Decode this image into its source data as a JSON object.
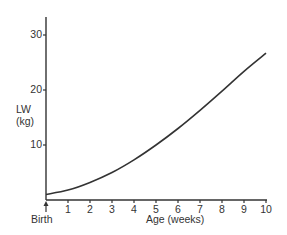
{
  "chart_data": {
    "type": "line",
    "title": "",
    "xlabel": "Age (weeks)",
    "ylabel": "LW (kg)",
    "ylabel_line1": "LW",
    "ylabel_line2": "(kg)",
    "origin_label": "Birth",
    "x": [
      0,
      1,
      2,
      3,
      4,
      5,
      6,
      7,
      8,
      9,
      10
    ],
    "series": [
      {
        "name": "Live weight",
        "values": [
          1.0,
          1.8,
          3.2,
          5.0,
          7.3,
          10.0,
          13.0,
          16.3,
          19.8,
          23.4,
          26.7
        ]
      }
    ],
    "xticks": [
      "1",
      "2",
      "3",
      "4",
      "5",
      "6",
      "7",
      "8",
      "9",
      "10"
    ],
    "yticks": [
      "10",
      "20",
      "30"
    ],
    "xlim": [
      0,
      10
    ],
    "ylim": [
      0,
      33
    ],
    "grid": false,
    "legend": "none"
  }
}
